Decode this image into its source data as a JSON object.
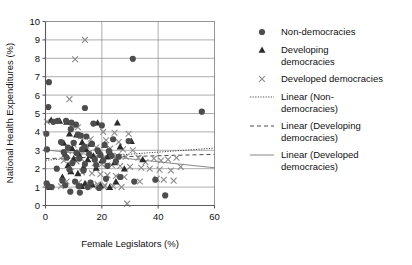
{
  "chart_data": {
    "type": "scatter",
    "title": "",
    "xlabel": "Female Legislators (%)",
    "ylabel": "National Health Expenditures (%)",
    "xlim": [
      0,
      60
    ],
    "ylim": [
      0,
      10
    ],
    "xticks": [
      "0",
      "20",
      "40",
      "60"
    ],
    "yticks": [
      "0",
      "1",
      "2",
      "3",
      "4",
      "5",
      "6",
      "7",
      "8",
      "9",
      "10"
    ],
    "grid": "horizontal-and-vertical",
    "legend_position": "right",
    "series": [
      {
        "name": "Non-democracies",
        "marker": "filled-circle",
        "color": "#4d4d4d",
        "points": [
          [
            1.2,
            6.7
          ],
          [
            1.0,
            5.35
          ],
          [
            0.3,
            3.9
          ],
          [
            0.5,
            3.05
          ],
          [
            0.4,
            1.2
          ],
          [
            1.0,
            1.05
          ],
          [
            2.2,
            1.0
          ],
          [
            31.0,
            7.97
          ],
          [
            14.0,
            5.3
          ],
          [
            4.3,
            4.6
          ],
          [
            7.3,
            4.6
          ],
          [
            9.2,
            4.5
          ],
          [
            17.0,
            4.45
          ],
          [
            20.0,
            4.35
          ],
          [
            9.0,
            4.15
          ],
          [
            11.5,
            3.85
          ],
          [
            12.5,
            3.8
          ],
          [
            14.5,
            3.75
          ],
          [
            24.0,
            3.6
          ],
          [
            29.5,
            3.5
          ],
          [
            5.5,
            3.45
          ],
          [
            10.0,
            3.4
          ],
          [
            16.5,
            3.35
          ],
          [
            21.0,
            3.3
          ],
          [
            8.0,
            3.15
          ],
          [
            13.0,
            3.05
          ],
          [
            18.5,
            3.0
          ],
          [
            22.5,
            2.95
          ],
          [
            6.5,
            2.9
          ],
          [
            11.0,
            2.85
          ],
          [
            15.5,
            2.8
          ],
          [
            19.5,
            2.75
          ],
          [
            23.5,
            2.7
          ],
          [
            7.5,
            2.6
          ],
          [
            12.0,
            2.55
          ],
          [
            17.5,
            2.5
          ],
          [
            20.5,
            2.45
          ],
          [
            25.0,
            2.4
          ],
          [
            9.5,
            2.3
          ],
          [
            14.0,
            2.25
          ],
          [
            18.0,
            2.2
          ],
          [
            22.0,
            2.15
          ],
          [
            4.0,
            2.0
          ],
          [
            8.5,
            1.95
          ],
          [
            13.5,
            1.9
          ],
          [
            26.5,
            1.55
          ],
          [
            21.5,
            1.45
          ],
          [
            39.0,
            1.4
          ],
          [
            6.0,
            1.35
          ],
          [
            10.5,
            1.3
          ],
          [
            31.5,
            1.3
          ],
          [
            16.0,
            1.25
          ],
          [
            7.0,
            1.1
          ],
          [
            11.8,
            1.05
          ],
          [
            15.0,
            1.0
          ],
          [
            19.0,
            0.95
          ],
          [
            8.8,
            0.75
          ],
          [
            12.2,
            0.7
          ],
          [
            42.5,
            0.55
          ],
          [
            55.5,
            5.1
          ],
          [
            26.0,
            2.65
          ],
          [
            2.8,
            4.55
          ],
          [
            10.8,
            4.4
          ],
          [
            13.8,
            3.2
          ]
        ]
      },
      {
        "name": "Developing democracies",
        "marker": "filled-triangle",
        "color": "#2b2b2b",
        "points": [
          [
            2.0,
            4.65
          ],
          [
            5.0,
            4.6
          ],
          [
            7.5,
            4.55
          ],
          [
            18.5,
            4.5
          ],
          [
            25.5,
            4.5
          ],
          [
            8.5,
            3.9
          ],
          [
            11.0,
            3.85
          ],
          [
            30.5,
            3.5
          ],
          [
            13.0,
            3.45
          ],
          [
            6.5,
            3.4
          ],
          [
            16.0,
            3.35
          ],
          [
            21.0,
            3.3
          ],
          [
            26.5,
            3.2
          ],
          [
            9.5,
            3.1
          ],
          [
            14.5,
            3.05
          ],
          [
            19.0,
            2.95
          ],
          [
            23.0,
            2.9
          ],
          [
            7.0,
            2.8
          ],
          [
            12.0,
            2.75
          ],
          [
            17.0,
            2.7
          ],
          [
            22.0,
            2.65
          ],
          [
            10.0,
            2.55
          ],
          [
            15.0,
            2.5
          ],
          [
            20.0,
            2.45
          ],
          [
            24.5,
            2.35
          ],
          [
            8.0,
            2.2
          ],
          [
            13.5,
            2.1
          ],
          [
            18.0,
            2.05
          ],
          [
            28.0,
            2.0
          ],
          [
            9.0,
            1.85
          ],
          [
            11.5,
            1.75
          ],
          [
            6.0,
            1.55
          ],
          [
            14.0,
            1.2
          ],
          [
            16.5,
            1.15
          ],
          [
            19.5,
            1.1
          ],
          [
            12.8,
            1.05
          ],
          [
            22.8,
            1.0
          ],
          [
            25.0,
            1.3
          ],
          [
            1.5,
            1.0
          ],
          [
            34.5,
            2.5
          ]
        ]
      },
      {
        "name": "Developed democracies",
        "marker": "cross-x",
        "color": "#8c8c8c",
        "points": [
          [
            14.0,
            9.0
          ],
          [
            10.5,
            7.95
          ],
          [
            8.5,
            5.78
          ],
          [
            0.5,
            4.55
          ],
          [
            9.5,
            4.35
          ],
          [
            11.5,
            4.25
          ],
          [
            20.5,
            4.0
          ],
          [
            24.5,
            3.95
          ],
          [
            29.5,
            3.9
          ],
          [
            12.5,
            3.75
          ],
          [
            16.0,
            3.6
          ],
          [
            21.5,
            3.55
          ],
          [
            26.0,
            3.45
          ],
          [
            10.0,
            3.3
          ],
          [
            14.5,
            3.25
          ],
          [
            18.0,
            3.15
          ],
          [
            23.0,
            3.1
          ],
          [
            27.5,
            3.05
          ],
          [
            31.0,
            3.0
          ],
          [
            8.0,
            2.95
          ],
          [
            12.0,
            2.9
          ],
          [
            15.5,
            2.85
          ],
          [
            19.0,
            2.8
          ],
          [
            22.5,
            2.75
          ],
          [
            25.5,
            2.7
          ],
          [
            28.5,
            2.65
          ],
          [
            33.0,
            2.6
          ],
          [
            38.5,
            2.55
          ],
          [
            43.5,
            2.5
          ],
          [
            6.5,
            2.45
          ],
          [
            11.0,
            2.4
          ],
          [
            14.0,
            2.35
          ],
          [
            17.5,
            2.3
          ],
          [
            20.0,
            2.25
          ],
          [
            23.5,
            2.2
          ],
          [
            26.5,
            2.15
          ],
          [
            30.0,
            2.1
          ],
          [
            34.0,
            2.05
          ],
          [
            37.0,
            2.0
          ],
          [
            40.5,
            1.95
          ],
          [
            44.5,
            1.9
          ],
          [
            48.0,
            2.1
          ],
          [
            9.0,
            1.85
          ],
          [
            13.0,
            1.8
          ],
          [
            16.5,
            1.75
          ],
          [
            19.5,
            1.7
          ],
          [
            22.0,
            1.65
          ],
          [
            25.0,
            1.6
          ],
          [
            28.0,
            1.55
          ],
          [
            39.5,
            1.45
          ],
          [
            42.0,
            1.4
          ],
          [
            45.5,
            1.35
          ],
          [
            7.5,
            1.3
          ],
          [
            11.8,
            1.25
          ],
          [
            15.0,
            1.2
          ],
          [
            18.5,
            1.15
          ],
          [
            21.0,
            1.1
          ],
          [
            24.0,
            1.05
          ],
          [
            27.0,
            1.0
          ],
          [
            33.5,
            1.3
          ],
          [
            29.0,
            0.1
          ],
          [
            5.5,
            1.05
          ],
          [
            17.0,
            1.05
          ],
          [
            20.8,
            1.0
          ],
          [
            35.5,
            2.35
          ],
          [
            41.0,
            2.45
          ],
          [
            46.5,
            2.6
          ]
        ]
      }
    ],
    "trendlines": [
      {
        "name": "Linear (Non-democracies)",
        "style": "dotted",
        "x0": 0,
        "y0": 2.46,
        "x1": 60,
        "y1": 3.12
      },
      {
        "name": "Linear (Developing democracies)",
        "style": "dashed",
        "x0": 0,
        "y0": 2.55,
        "x1": 60,
        "y1": 2.78
      },
      {
        "name": "Linear (Developed democracies)",
        "style": "solid",
        "x0": 0,
        "y0": 3.02,
        "x1": 60,
        "y1": 2.05
      }
    ]
  },
  "legend": {
    "items": [
      {
        "label": "Non-democracies",
        "marker": "filled-circle"
      },
      {
        "label": "Developing democracies",
        "marker": "filled-triangle"
      },
      {
        "label": "Developed democracies",
        "marker": "cross-x"
      },
      {
        "label": "Linear (Non-democracies)",
        "marker": "dotted-line"
      },
      {
        "label": "Linear (Developing democracies)",
        "marker": "dashed-line"
      },
      {
        "label": "Linear (Developed democracies)",
        "marker": "solid-line"
      }
    ]
  }
}
